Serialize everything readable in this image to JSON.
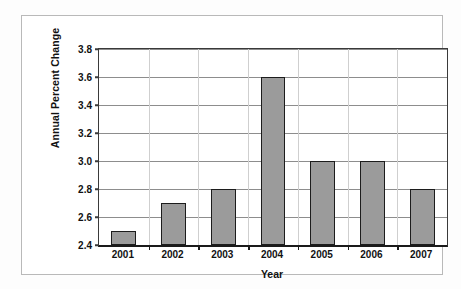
{
  "chart_data": {
    "type": "bar",
    "title": "",
    "subtitle": "",
    "xlabel": "Year",
    "ylabel": "Annual Percent Change",
    "categories": [
      "2001",
      "2002",
      "2003",
      "2004",
      "2005",
      "2006",
      "2007"
    ],
    "values": [
      2.5,
      2.7,
      2.8,
      3.6,
      3.0,
      3.0,
      2.8
    ],
    "series": [
      {
        "name": "Annual Percent Change",
        "values": [
          2.5,
          2.7,
          2.8,
          3.6,
          3.0,
          3.0,
          2.8
        ]
      }
    ],
    "ylim": [
      2.4,
      3.8
    ],
    "ytick_values": [
      2.4,
      2.6,
      2.8,
      3.0,
      3.2,
      3.4,
      3.6,
      3.8
    ],
    "ytick_labels": [
      "2.4",
      "2.6",
      "2.8",
      "3.0",
      "3.2",
      "3.4",
      "3.6",
      "3.8"
    ],
    "grid": true,
    "grid_axis": "both",
    "legend": false,
    "legend_position": "none",
    "bar_fill_color": "#9b9b9b",
    "bar_edge_color": "#1c1c1c",
    "gridline_color": "#8d8d8d",
    "axis_color": "#1a1a1a",
    "background_color": "#ffffff",
    "bar_width_ratio": 0.5
  }
}
